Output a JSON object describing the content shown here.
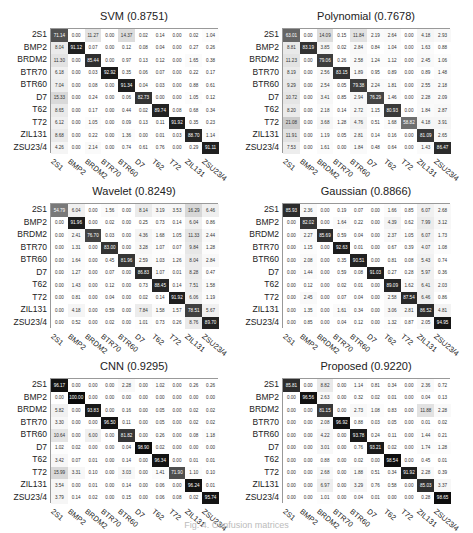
{
  "figure": {
    "caption": "Fig. 4. Confusion matrices"
  },
  "chart_data": [
    {
      "type": "heatmap",
      "title": "SVM (0.8751)",
      "x_labels": [
        "2S1",
        "BMP2",
        "BRDM2",
        "BTR70",
        "BTR60",
        "D7",
        "T62",
        "T72",
        "ZIL131",
        "ZSU23/4"
      ],
      "y_labels": [
        "2S1",
        "BMP2",
        "BRDM2",
        "BTR70",
        "BTR60",
        "D7",
        "T62",
        "T72",
        "ZIL131",
        "ZSU23/4"
      ],
      "values": [
        [
          71.14,
          0.0,
          11.27,
          0.0,
          14.37,
          0.02,
          0.14,
          0.0,
          0.02,
          1.04
        ],
        [
          8.04,
          91.12,
          0.07,
          0.0,
          0.12,
          0.08,
          0.04,
          0.0,
          0.27,
          0.26
        ],
        [
          11.3,
          0.0,
          85.44,
          0.0,
          0.97,
          0.13,
          0.12,
          0.0,
          1.65,
          0.38
        ],
        [
          6.18,
          0.0,
          0.03,
          92.92,
          0.35,
          0.06,
          0.07,
          0.0,
          0.22,
          0.17
        ],
        [
          7.04,
          0.0,
          0.08,
          0.0,
          91.34,
          0.04,
          0.03,
          0.0,
          0.88,
          0.61
        ],
        [
          15.33,
          0.0,
          0.24,
          0.0,
          0.06,
          82.73,
          0.0,
          0.0,
          1.05,
          0.12
        ],
        [
          8.65,
          0.0,
          0.17,
          0.0,
          0.44,
          0.02,
          89.74,
          0.08,
          0.68,
          0.34
        ],
        [
          6.12,
          0.0,
          1.05,
          0.0,
          0.09,
          0.13,
          0.11,
          91.92,
          0.35,
          0.23
        ],
        [
          8.68,
          0.0,
          0.22,
          0.0,
          1.36,
          0.0,
          0.01,
          0.03,
          88.7,
          1.14
        ],
        [
          4.26,
          0.0,
          2.14,
          0.0,
          0.74,
          0.61,
          0.76,
          0.0,
          0.29,
          91.11
        ]
      ]
    },
    {
      "type": "heatmap",
      "title": "Polynomial (0.7678)",
      "x_labels": [
        "2S1",
        "BMP2",
        "BRDM2",
        "BTR70",
        "BTR60",
        "D7",
        "T62",
        "T72",
        "ZIL131",
        "ZSU23/4"
      ],
      "y_labels": [
        "2S1",
        "BMP2",
        "BRDM2",
        "BTR70",
        "BTR60",
        "D7",
        "T62",
        "T72",
        "ZIL131",
        "ZSU23/4"
      ],
      "values": [
        [
          63.01,
          0.0,
          14.09,
          0.15,
          11.84,
          2.19,
          2.64,
          0.0,
          4.18,
          2.93
        ],
        [
          8.81,
          83.19,
          3.85,
          0.02,
          2.84,
          0.84,
          1.04,
          0.0,
          1.63,
          0.88
        ],
        [
          11.23,
          0.0,
          79.06,
          0.26,
          2.58,
          1.24,
          1.12,
          0.0,
          2.45,
          1.06
        ],
        [
          8.19,
          0.0,
          2.56,
          83.15,
          1.89,
          0.95,
          0.89,
          0.0,
          0.89,
          1.48
        ],
        [
          9.29,
          0.0,
          2.54,
          0.05,
          79.38,
          2.24,
          1.81,
          0.0,
          2.55,
          2.18
        ],
        [
          10.72,
          0.0,
          3.41,
          0.85,
          2.94,
          76.29,
          1.46,
          0.0,
          2.28,
          2.09
        ],
        [
          8.2,
          0.0,
          2.18,
          0.14,
          2.72,
          1.15,
          80.93,
          0.0,
          1.84,
          2.87
        ],
        [
          21.08,
          0.0,
          3.68,
          1.28,
          4.76,
          0.51,
          1.68,
          58.82,
          4.18,
          3.91
        ],
        [
          11.91,
          0.0,
          1.19,
          0.05,
          2.81,
          0.14,
          0.16,
          0.0,
          81.09,
          2.65
        ],
        [
          7.53,
          0.0,
          1.61,
          0.0,
          1.84,
          0.48,
          0.64,
          0.0,
          1.43,
          86.47
        ]
      ]
    },
    {
      "type": "heatmap",
      "title": "Wavelet (0.8249)",
      "x_labels": [
        "2S1",
        "BMP2",
        "BRDM2",
        "BTR70",
        "BTR60",
        "D7",
        "T62",
        "T72",
        "ZIL131",
        "ZSU23/4"
      ],
      "y_labels": [
        "2S1",
        "BMP2",
        "BRDM2",
        "BTR70",
        "BTR60",
        "D7",
        "T62",
        "T72",
        "ZIL131",
        "ZSU23/4"
      ],
      "values": [
        [
          54.79,
          6.04,
          0.0,
          1.56,
          0.0,
          8.14,
          3.19,
          3.53,
          16.29,
          6.46
        ],
        [
          0.0,
          91.96,
          0.0,
          0.02,
          0.0,
          0.25,
          0.73,
          0.14,
          6.04,
          0.86
        ],
        [
          0.0,
          2.41,
          76.7,
          0.03,
          0.0,
          4.36,
          1.68,
          1.05,
          11.33,
          2.44
        ],
        [
          0.0,
          1.31,
          0.0,
          83.0,
          0.0,
          3.28,
          1.07,
          0.07,
          9.84,
          1.28
        ],
        [
          0.0,
          1.64,
          0.0,
          0.45,
          81.96,
          2.59,
          1.03,
          1.26,
          8.04,
          2.84
        ],
        [
          0.0,
          1.27,
          0.0,
          0.07,
          0.0,
          86.83,
          1.07,
          0.01,
          8.28,
          0.47
        ],
        [
          0.0,
          1.43,
          0.0,
          0.12,
          0.0,
          0.73,
          88.45,
          0.14,
          7.51,
          1.58
        ],
        [
          0.0,
          0.81,
          0.0,
          0.04,
          0.0,
          0.02,
          0.14,
          91.92,
          6.06,
          1.19
        ],
        [
          0.0,
          4.18,
          0.0,
          0.59,
          0.0,
          7.84,
          1.58,
          1.57,
          78.51,
          5.67
        ],
        [
          0.0,
          0.52,
          0.0,
          0.02,
          0.0,
          1.01,
          0.73,
          0.26,
          8.76,
          89.7
        ]
      ]
    },
    {
      "type": "heatmap",
      "title": "Gaussian (0.8866)",
      "x_labels": [
        "2S1",
        "BMP2",
        "BRDM2",
        "BTR70",
        "BTR60",
        "D7",
        "T62",
        "T72",
        "ZIL131",
        "ZSU23/4"
      ],
      "y_labels": [
        "2S1",
        "BMP2",
        "BRDM2",
        "BTR70",
        "BTR60",
        "D7",
        "T62",
        "T72",
        "ZIL131",
        "ZSU23/4"
      ],
      "values": [
        [
          85.93,
          2.36,
          0.0,
          0.19,
          0.07,
          0.0,
          1.66,
          0.85,
          6.07,
          2.68
        ],
        [
          0.0,
          82.02,
          0.0,
          1.64,
          0.22,
          0.0,
          4.39,
          0.62,
          7.99,
          3.12
        ],
        [
          0.0,
          2.27,
          85.69,
          0.59,
          0.04,
          0.0,
          2.37,
          1.05,
          6.07,
          1.73
        ],
        [
          0.0,
          1.15,
          0.0,
          92.63,
          0.01,
          0.0,
          0.67,
          0.39,
          4.07,
          1.08
        ],
        [
          0.0,
          2.08,
          0.0,
          0.35,
          90.51,
          0.0,
          0.81,
          0.08,
          5.43,
          0.74
        ],
        [
          0.0,
          1.44,
          0.0,
          0.59,
          0.08,
          91.03,
          0.27,
          0.28,
          5.97,
          0.36
        ],
        [
          0.0,
          0.12,
          0.0,
          0.02,
          0.01,
          0.0,
          89.09,
          1.62,
          6.41,
          2.03
        ],
        [
          0.0,
          2.45,
          0.0,
          0.07,
          0.04,
          0.0,
          2.58,
          87.54,
          6.46,
          0.86
        ],
        [
          0.0,
          1.35,
          0.0,
          1.61,
          0.34,
          0.0,
          3.06,
          2.81,
          86.52,
          4.81
        ],
        [
          0.0,
          0.85,
          0.0,
          0.04,
          0.12,
          0.0,
          1.32,
          0.87,
          2.05,
          94.95
        ]
      ]
    },
    {
      "type": "heatmap",
      "title": "CNN (0.9295)",
      "x_labels": [
        "2S1",
        "BMP2",
        "BRDM2",
        "BTR70",
        "BTR60",
        "D7",
        "T62",
        "T72",
        "ZIL131",
        "ZSU23/4"
      ],
      "y_labels": [
        "2S1",
        "BMP2",
        "BRDM2",
        "BTR70",
        "BTR60",
        "D7",
        "T62",
        "T72",
        "ZIL131",
        "ZSU23/4"
      ],
      "values": [
        [
          96.17,
          0.0,
          0.0,
          0.0,
          2.28,
          0.0,
          1.02,
          0.0,
          0.26,
          0.26
        ],
        [
          0.0,
          100.0,
          0.0,
          0.0,
          0.0,
          0.0,
          0.0,
          0.0,
          0.0,
          0.0
        ],
        [
          5.82,
          0.0,
          93.83,
          0.0,
          0.16,
          0.0,
          0.05,
          0.0,
          0.02,
          0.02
        ],
        [
          3.3,
          0.0,
          0.0,
          96.5,
          0.11,
          0.0,
          0.05,
          0.0,
          0.02,
          0.02
        ],
        [
          10.64,
          0.0,
          6.0,
          0.0,
          81.82,
          0.0,
          0.26,
          0.0,
          0.08,
          1.18
        ],
        [
          1.02,
          0.02,
          0.0,
          0.0,
          0.04,
          98.9,
          0.02,
          0.0,
          0.0,
          0.0
        ],
        [
          3.42,
          0.07,
          0.01,
          0.0,
          0.14,
          0.0,
          96.34,
          0.0,
          0.01,
          0.01
        ],
        [
          15.99,
          3.31,
          0.1,
          0.0,
          3.03,
          0.0,
          1.41,
          71.9,
          1.1,
          0.1
        ],
        [
          3.54,
          0.0,
          0.01,
          0.0,
          0.14,
          0.0,
          0.06,
          0.0,
          96.24,
          0.01
        ],
        [
          3.79,
          0.14,
          0.02,
          0.0,
          0.15,
          0.0,
          0.06,
          0.08,
          0.02,
          95.74
        ]
      ]
    },
    {
      "type": "heatmap",
      "title": "Proposed (0.9220)",
      "x_labels": [
        "2S1",
        "BMP2",
        "BRDM2",
        "BTR70",
        "BTR60",
        "D7",
        "T62",
        "T72",
        "ZIL131",
        "ZSU23/4"
      ],
      "y_labels": [
        "2S1",
        "BMP2",
        "BRDM2",
        "BTR70",
        "BTR60",
        "D7",
        "T62",
        "T72",
        "ZIL131",
        "ZSU23/4"
      ],
      "values": [
        [
          85.81,
          0.0,
          8.82,
          0.0,
          1.14,
          0.81,
          0.34,
          0.0,
          2.36,
          0.72
        ],
        [
          0.0,
          96.56,
          2.63,
          0.0,
          0.32,
          0.02,
          0.01,
          0.0,
          0.04,
          0.13
        ],
        [
          0.0,
          0.0,
          81.15,
          0.0,
          2.73,
          1.08,
          0.83,
          0.0,
          11.88,
          2.28
        ],
        [
          0.0,
          0.0,
          2.08,
          96.92,
          0.88,
          0.03,
          0.05,
          0.0,
          0.01,
          0.02
        ],
        [
          0.0,
          0.0,
          4.22,
          0.0,
          93.78,
          0.24,
          0.11,
          0.0,
          1.44,
          0.21
        ],
        [
          0.0,
          0.0,
          3.01,
          0.0,
          0.76,
          93.21,
          0.02,
          0.0,
          1.74,
          1.28
        ],
        [
          0.0,
          0.0,
          0.88,
          0.0,
          0.02,
          0.0,
          98.54,
          0.0,
          0.45,
          0.01
        ],
        [
          0.0,
          0.0,
          2.68,
          0.0,
          1.88,
          0.51,
          0.34,
          91.92,
          2.28,
          0.39
        ],
        [
          0.0,
          0.0,
          6.97,
          0.0,
          3.29,
          0.76,
          0.58,
          0.0,
          85.03,
          3.37
        ],
        [
          0.0,
          0.0,
          1.01,
          0.0,
          0.04,
          0.01,
          0.0,
          0.0,
          0.28,
          98.65
        ]
      ]
    }
  ]
}
